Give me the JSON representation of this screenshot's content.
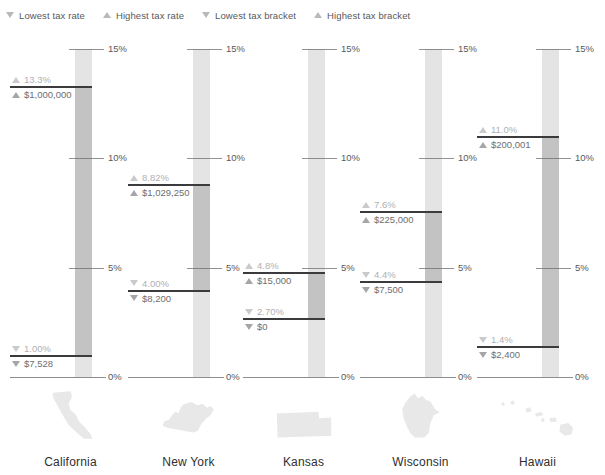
{
  "legend": {
    "items": [
      {
        "glyph": "triangle-down",
        "label": "Lowest tax rate"
      },
      {
        "glyph": "triangle-up",
        "label": "Highest tax rate"
      },
      {
        "glyph": "triangle-down",
        "label": "Lowest tax bracket"
      },
      {
        "glyph": "triangle-up",
        "label": "Highest tax bracket"
      }
    ]
  },
  "chart_data": {
    "type": "bar",
    "title": "",
    "xlabel": "",
    "ylabel": "",
    "ylim": [
      0,
      15
    ],
    "yticks": [
      0,
      5,
      10,
      15
    ],
    "ytick_labels": [
      "0%",
      "5%",
      "10%",
      "15%"
    ],
    "grid": false,
    "legend_position": "top-left",
    "categories": [
      "California",
      "New York",
      "Kansas",
      "Wisconsin",
      "Hawaii"
    ],
    "series": [
      {
        "name": "Lowest tax rate",
        "values": [
          1.0,
          4.0,
          2.7,
          4.4,
          1.4
        ]
      },
      {
        "name": "Highest tax rate",
        "values": [
          13.3,
          8.82,
          4.8,
          7.6,
          11.0
        ]
      }
    ],
    "states": [
      {
        "name": "California",
        "high_rate": 13.3,
        "low_rate": 1.0,
        "high_rate_label": "13.3%",
        "low_rate_label": "1.00%",
        "high_bracket_label": "$1,000,000",
        "low_bracket_label": "$7,528"
      },
      {
        "name": "New York",
        "high_rate": 8.82,
        "low_rate": 4.0,
        "high_rate_label": "8.82%",
        "low_rate_label": "4.00%",
        "high_bracket_label": "$1,029,250",
        "low_bracket_label": "$8,200"
      },
      {
        "name": "Kansas",
        "high_rate": 4.8,
        "low_rate": 2.7,
        "high_rate_label": "4.8%",
        "low_rate_label": "2.70%",
        "high_bracket_label": "$15,000",
        "low_bracket_label": "$0"
      },
      {
        "name": "Wisconsin",
        "high_rate": 7.6,
        "low_rate": 4.4,
        "high_rate_label": "7.6%",
        "low_rate_label": "4.4%",
        "high_bracket_label": "$225,000",
        "low_bracket_label": "$7,500"
      },
      {
        "name": "Hawaii",
        "high_rate": 11.0,
        "low_rate": 1.4,
        "high_rate_label": "11.0%",
        "low_rate_label": "1.4%",
        "high_bracket_label": "$200,001",
        "low_bracket_label": "$2,400"
      }
    ]
  },
  "colors": {
    "bar_track": "#e4e4e4",
    "bar_range": "#c3c3c3",
    "rule": "#3b3b3d",
    "axis_text": "#59595b",
    "rate_text": "#b0b0b2",
    "bracket_text": "#6e6e70",
    "state_shape": "#e8e8e8",
    "state_name": "#2f2f31"
  }
}
